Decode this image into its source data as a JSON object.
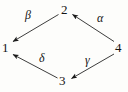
{
  "figure": {
    "kind": "commutative-diagram",
    "shape": "diamond",
    "background_color": "#fdfdfb",
    "stroke_color": "#1a1a1a",
    "text_color": "#141414"
  },
  "nodes": [
    {
      "id": "1",
      "label": "1",
      "position": "left",
      "x": 6,
      "y": 48
    },
    {
      "id": "2",
      "label": "2",
      "position": "top",
      "x": 65,
      "y": 10
    },
    {
      "id": "3",
      "label": "3",
      "position": "bottom",
      "x": 63,
      "y": 81
    },
    {
      "id": "4",
      "label": "4",
      "position": "right",
      "x": 119,
      "y": 48
    }
  ],
  "edges": [
    {
      "id": "alpha",
      "label": "α",
      "from": "4",
      "to": "2",
      "direction": "up-left",
      "label_x": 101,
      "label_y": 18
    },
    {
      "id": "beta",
      "label": "β",
      "from": "2",
      "to": "1",
      "direction": "down-left",
      "label_x": 30,
      "label_y": 16
    },
    {
      "id": "gamma",
      "label": "γ",
      "from": "4",
      "to": "3",
      "direction": "down-left",
      "label_x": 89,
      "label_y": 61
    },
    {
      "id": "delta",
      "label": "δ",
      "from": "3",
      "to": "1",
      "direction": "up-left",
      "label_x": 43,
      "label_y": 59
    }
  ]
}
